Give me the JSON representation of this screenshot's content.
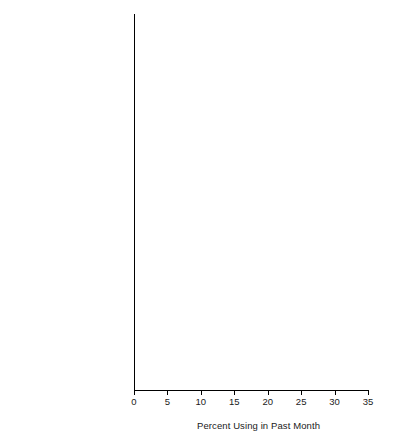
{
  "chart_data": {
    "type": "bar",
    "orientation": "horizontal",
    "title": "",
    "xlabel": "Percent Using in Past Month",
    "ylabel": "",
    "xlim": [
      0,
      35
    ],
    "xticks": [
      0,
      5,
      10,
      15,
      20,
      25,
      30,
      35
    ],
    "grid": false,
    "legend_position": "bottom-right",
    "legend": [
      "White",
      "Black",
      "Hispanic"
    ],
    "series_colors": [
      "#4a4a4a",
      "#a0a0a0",
      "#dcdcdc"
    ],
    "categories": [
      "Current Use",
      "Binge Use",
      "Heavy Use"
    ],
    "groups": [
      {
        "label_lines": [
          "Metropolitan"
        ],
        "categories": [
          "Current Use",
          "Binge Use",
          "Heavy Use"
        ],
        "series": [
          {
            "name": "White",
            "values": [
              33.2,
              22.9,
              8.2
            ]
          },
          {
            "name": "Black",
            "values": [
              18.5,
              9.0,
              1.7
            ]
          },
          {
            "name": "Hispanic",
            "values": [
              25.3,
              17.0,
              4.1
            ]
          }
        ]
      },
      {
        "label_lines": [
          "Nonmetropolitan,",
          "Urbanized",
          "(Urban Pop. ≥20K)"
        ],
        "categories": [
          "Current Use",
          "Binge Use",
          "Heavy Use"
        ],
        "series": [
          {
            "name": "White",
            "values": [
              33.0,
              23.6,
              9.1
            ]
          },
          {
            "name": "Black",
            "values": [
              23.0,
              14.2,
              2.4
            ]
          },
          {
            "name": "Hispanic",
            "values": [
              29.1,
              21.1,
              8.7
            ]
          }
        ]
      },
      {
        "label_lines": [
          "Nonmetropolitan, Rural",
          "(Urban Pop. < 20K)"
        ],
        "categories": [
          "Current Use",
          "Binge Use",
          "Heavy Use"
        ],
        "series": [
          {
            "name": "White",
            "values": [
              28.9,
              20.7,
              6.3
            ]
          },
          {
            "name": "Black",
            "values": [
              19.6,
              10.4,
              1.8
            ]
          },
          {
            "name": "Hispanic",
            "values": [
              32.4,
              24.7,
              7.9
            ]
          }
        ]
      }
    ]
  },
  "axis": {
    "tick_labels": [
      "0",
      "5",
      "10",
      "15",
      "20",
      "25",
      "30",
      "35"
    ],
    "title": "Percent Using in Past Month"
  },
  "legend": {
    "items": [
      {
        "label": "White",
        "color": "#4a4a4a"
      },
      {
        "label": "Black",
        "color": "#a0a0a0"
      },
      {
        "label": "Hispanic",
        "color": "#f0f0f0"
      }
    ]
  }
}
